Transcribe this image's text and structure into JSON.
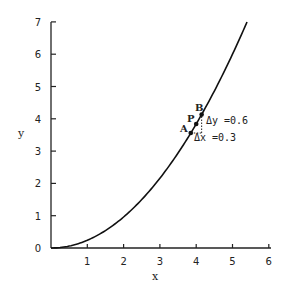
{
  "chart_data": {
    "type": "line",
    "title": "",
    "xlabel": "x",
    "ylabel": "y",
    "xlim": [
      0,
      6
    ],
    "ylim": [
      0,
      7
    ],
    "x_ticks": [
      1,
      2,
      3,
      4,
      5,
      6
    ],
    "y_ticks": [
      0,
      1,
      2,
      3,
      4,
      5,
      6,
      7
    ],
    "grid": false,
    "legend": null,
    "series": [
      {
        "name": "curve",
        "function_approx": "y = 0.24 x^2",
        "x": [
          0,
          0.5,
          1,
          1.5,
          2,
          2.5,
          3,
          3.5,
          4,
          4.5,
          5,
          5.4
        ],
        "y": [
          0,
          0.06,
          0.24,
          0.54,
          0.96,
          1.5,
          2.16,
          2.94,
          3.84,
          4.86,
          6.0,
          7.0
        ]
      }
    ],
    "points": [
      {
        "label": "A",
        "x": 3.85,
        "y": 3.56
      },
      {
        "label": "P",
        "x": 4.0,
        "y": 3.84
      },
      {
        "label": "B",
        "x": 4.15,
        "y": 4.13
      }
    ],
    "annotations": [
      {
        "text": "Δy =0.6",
        "near": "B"
      },
      {
        "text": "Δx =0.3",
        "near": "A"
      }
    ]
  },
  "labels": {
    "x_axis": "x",
    "y_axis": "y",
    "point_a": "A",
    "point_p": "P",
    "point_b": "B",
    "delta_y": "Δy =0.6",
    "delta_x": "Δx =0.3",
    "x_tick_labels": [
      "1",
      "2",
      "3",
      "4",
      "5",
      "6"
    ],
    "y_tick_labels": [
      "0",
      "1",
      "2",
      "3",
      "4",
      "5",
      "6",
      "7"
    ]
  }
}
